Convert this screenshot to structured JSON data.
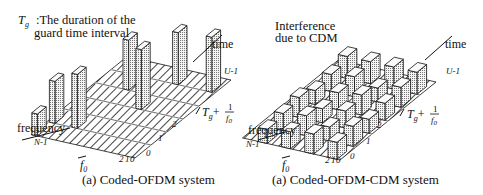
{
  "figure": {
    "left_panel": {
      "caption": "(a) Coded-OFDM system",
      "annotation_symbol": "T",
      "annotation_symbol_sub": "g",
      "annotation_line1": ":The duration of the",
      "annotation_line2": "guard time interval",
      "axis_time": "time",
      "axis_frequency": "frequency",
      "time_ticks": [
        "0",
        "1",
        "2",
        "U-1"
      ],
      "freq_ticks": [
        "0",
        "1",
        "2",
        "N-1"
      ],
      "time_step_label_main": "T",
      "time_step_label_sub": "g",
      "time_step_label_plus": "+",
      "time_step_label_num": "1",
      "time_step_label_den": "f",
      "time_step_label_den_sub": "0",
      "freq_step_label": "f",
      "freq_step_label_sub": "0"
    },
    "right_panel": {
      "caption": "(a) Coded-OFDM-CDM system",
      "annotation_line1": "Interference",
      "annotation_line2": "due to CDM",
      "axis_time": "time",
      "axis_frequency": "frequency",
      "time_ticks": [
        "0",
        "1",
        "2",
        "U-1"
      ],
      "freq_ticks": [
        "0",
        "1",
        "2",
        "N-1"
      ],
      "time_step_label_main": "T",
      "time_step_label_sub": "g",
      "time_step_label_plus": "+",
      "time_step_label_num": "1",
      "time_step_label_den": "f",
      "time_step_label_den_sub": "0",
      "freq_step_label": "f",
      "freq_step_label_sub": "0"
    }
  }
}
